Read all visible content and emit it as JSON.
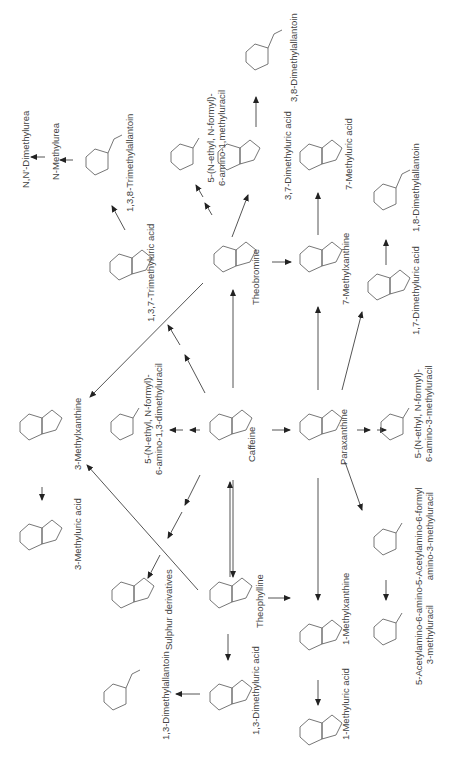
{
  "diagram": {
    "orientation": "rotated -90deg",
    "nodes": [
      {
        "id": "caffeine",
        "label": "Caffeine",
        "type": "xanthine"
      },
      {
        "id": "theobromine",
        "label": "Theobromine",
        "type": "xanthine"
      },
      {
        "id": "paraxanthine",
        "label": "Paraxanthine",
        "type": "xanthine"
      },
      {
        "id": "theophylline",
        "label": "Theophylline",
        "type": "xanthine"
      },
      {
        "id": "tmu",
        "label": "1,3,7-Trimethyluric acid",
        "type": "uric"
      },
      {
        "id": "tma",
        "label": "1,3,8-Trimethylallantoin",
        "type": "allantoin"
      },
      {
        "id": "nmu",
        "label": "N-Methylurea",
        "type": "text"
      },
      {
        "id": "ndmu",
        "label": "N,N'-Dimethylurea",
        "type": "text"
      },
      {
        "id": "famu1",
        "label_lines": [
          "5-(N-ethyl, N-formyl)-",
          "6-amino-1,methyluracil"
        ],
        "type": "uracil"
      },
      {
        "id": "dmu37",
        "label": "3,7-Dimethyluric acid",
        "type": "uric"
      },
      {
        "id": "dma38",
        "label": "3,8-Dimethylallantoin",
        "type": "allantoin"
      },
      {
        "id": "mx7",
        "label": "7-Methylxanthine",
        "type": "xanthine"
      },
      {
        "id": "mu7",
        "label": "7-Methyluric acid",
        "type": "uric"
      },
      {
        "id": "dmu17",
        "label": "1,7-Dimethyluric acid",
        "type": "uric"
      },
      {
        "id": "dma18",
        "label": "1,8-Dimethylallantoin",
        "type": "allantoin"
      },
      {
        "id": "famu3",
        "label_lines": [
          "5-(N-ethyl, N-formyl)-",
          "6-amino-3-methyluracil"
        ],
        "type": "uracil"
      },
      {
        "id": "afmu",
        "label_lines": [
          "5-Acetylamino-6-formyl",
          "amino-3-methyluracil"
        ],
        "type": "uracil"
      },
      {
        "id": "aamu",
        "label_lines": [
          "5-Acetylamino-6-amino-",
          "3-methyluracil"
        ],
        "type": "uracil"
      },
      {
        "id": "mx1",
        "label": "1-Methylxanthine",
        "type": "xanthine"
      },
      {
        "id": "mu1",
        "label": "1-Methyluric acid",
        "type": "uric"
      },
      {
        "id": "dmu13",
        "label": "1,3-Dimethyluric acid",
        "type": "uric"
      },
      {
        "id": "dma13",
        "label": "1,3-Dimethylallantoin",
        "type": "allantoin"
      },
      {
        "id": "sulphur",
        "label": "Sulphur derivatives",
        "type": "xanthine"
      },
      {
        "id": "mx3",
        "label": "3-Methylxanthine",
        "type": "xanthine"
      },
      {
        "id": "mu3",
        "label": "3-Methyluric acid",
        "type": "uric"
      },
      {
        "id": "famu13",
        "label_lines": [
          "5-(N-ethyl, N-formyl)-",
          "6-amino-1,3-dimethyluracil"
        ],
        "type": "uracil"
      }
    ],
    "atoms": {
      "ch3": "CH3",
      "h3c": "H3C",
      "o": "O",
      "n": "N",
      "nh": "NH",
      "hn": "HN",
      "cho": "N–CHO",
      "nh2": "NH2",
      "coch3": "N–COCH3",
      "s": "CH2–S–CH3"
    }
  }
}
